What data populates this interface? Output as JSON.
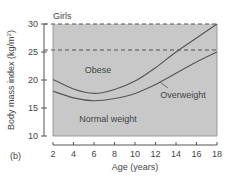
{
  "panel_label": "(b)",
  "chart_data": {
    "type": "line",
    "title": "Girls",
    "xlabel": "Age (years)",
    "ylabel": "Body mass index (kg/m²)",
    "ylabel_main": "Body mass index (kg/m",
    "ylabel_sup": "2",
    "ylabel_end": ")",
    "xlim": [
      2,
      18
    ],
    "ylim": [
      10,
      30
    ],
    "x_ticks": [
      2,
      4,
      6,
      8,
      10,
      12,
      14,
      16,
      18
    ],
    "x_tick_labels": [
      "2",
      "4",
      "6",
      "8",
      "10",
      "12",
      "14",
      "16",
      "18"
    ],
    "y_ticks": [
      10,
      15,
      20,
      25,
      30
    ],
    "y_tick_labels": [
      "10",
      "15",
      "20",
      "25",
      "30"
    ],
    "reference_lines": [
      {
        "y": 25,
        "style": "dashed"
      },
      {
        "y": 30,
        "style": "dashed"
      }
    ],
    "grid": false,
    "background_fill": "#c8c8c8",
    "line_color": "#555555",
    "x": [
      2,
      4,
      6,
      8,
      10,
      12,
      14,
      16,
      18
    ],
    "series": [
      {
        "name": "Obese cutoff",
        "values": [
          20.1,
          18.4,
          17.6,
          18.3,
          19.8,
          22.2,
          25.0,
          27.5,
          30.0
        ]
      },
      {
        "name": "Overweight cutoff",
        "values": [
          18.0,
          16.8,
          16.3,
          16.7,
          17.6,
          19.2,
          21.2,
          23.2,
          25.0
        ]
      }
    ],
    "annotations": [
      {
        "text": "Obese",
        "x": 7.5,
        "y": 22.5
      },
      {
        "text": "Overweight",
        "x": 13.5,
        "y": 17.8,
        "arrow_to": [
          12.0,
          19.2
        ]
      },
      {
        "text": "Normal weight",
        "x": 7.5,
        "y": 13.7
      }
    ]
  }
}
